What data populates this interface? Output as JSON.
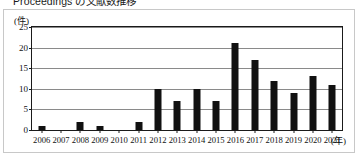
{
  "figure": {
    "title": "Proceedings の文献数推移"
  },
  "axes": {
    "y_unit": "(件)",
    "x_unit": "(年)"
  },
  "chart_data": {
    "type": "bar",
    "title": "Proceedings の文献数推移",
    "xlabel": "(年)",
    "ylabel": "(件)",
    "ylim": [
      0,
      25
    ],
    "yticks": [
      0,
      5,
      10,
      15,
      20,
      25
    ],
    "grid": true,
    "legend": false,
    "bar_color": "#111111",
    "categories": [
      "2006",
      "2007",
      "2008",
      "2009",
      "2010",
      "2011",
      "2012",
      "2013",
      "2014",
      "2015",
      "2016",
      "2017",
      "2018",
      "2019",
      "2020",
      "2021"
    ],
    "values": [
      1,
      0,
      2,
      1,
      0,
      2,
      10,
      7,
      10,
      7,
      21,
      17,
      12,
      9,
      13,
      11
    ]
  }
}
